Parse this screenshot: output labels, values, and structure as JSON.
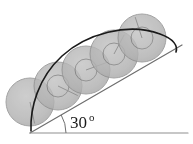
{
  "figure": {
    "angle_label": "30",
    "angle_degree_symbol": "o",
    "angle_value_deg": 30,
    "colors": {
      "disk_fill": "#b3b3b3",
      "disk_stroke": "#8c8c8c",
      "disk_overlap_fill": "#9c9c9c",
      "cycloid_stroke": "#1a1a1a",
      "incline_stroke": "#6e6e6e",
      "ground_stroke": "#8f8f8f",
      "background": "#ffffff",
      "label_color": "#1a1a1a"
    },
    "ground_line": {
      "label": "horizontal-ground",
      "x1": 30,
      "y1": 133,
      "x2": 188,
      "y2": 133
    },
    "incline_line": {
      "label": "inclined-plane-surface",
      "x1": 30,
      "y1": 133,
      "x2": 182,
      "y2": 45
    },
    "angle_arc": {
      "label": "angle-arc-30-degrees",
      "vertex_x": 30,
      "vertex_y": 133,
      "radius": 36
    },
    "disks": [
      {
        "name": "disk-1",
        "cx": 30,
        "cy": 102,
        "r": 24,
        "spoke_angle_deg": 78,
        "has_inner_circle": false,
        "inner_r": 0
      },
      {
        "name": "disk-2",
        "cx": 58,
        "cy": 86,
        "r": 24,
        "spoke_angle_deg": 26,
        "has_inner_circle": true,
        "inner_r": 11
      },
      {
        "name": "disk-3",
        "cx": 86,
        "cy": 70,
        "r": 24,
        "spoke_angle_deg": -20,
        "has_inner_circle": true,
        "inner_r": 11
      },
      {
        "name": "disk-4",
        "cx": 114,
        "cy": 54,
        "r": 24,
        "spoke_angle_deg": -62,
        "has_inner_circle": true,
        "inner_r": 11
      },
      {
        "name": "disk-5",
        "cx": 142,
        "cy": 38,
        "r": 24,
        "spoke_angle_deg": -108,
        "has_inner_circle": true,
        "inner_r": 11
      }
    ],
    "cycloid": {
      "label": "cycloid-trace-curve",
      "description": "arc traced by a point on the rim of the rolling disk",
      "path": "M 31 131 C 30 108, 38 78, 62 56 C 86 34, 128 22, 160 34 C 174 39, 178 46, 176 52"
    }
  }
}
